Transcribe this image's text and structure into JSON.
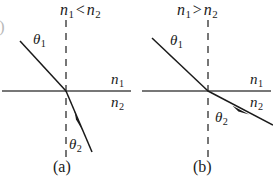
{
  "figure": {
    "background_color": "#ffffff",
    "ink_color": "#1a1a1a",
    "edge_artifact": ")"
  },
  "panels": [
    {
      "id": "a",
      "caption": "(a)",
      "condition": {
        "n_first": "n",
        "n_first_sub": "1",
        "relation": "<",
        "n_second": "n",
        "n_second_sub": "2",
        "full": "n1 < n2"
      },
      "incident_angle_label": "θ",
      "incident_angle_sub": "1",
      "refracted_angle_label": "θ",
      "refracted_angle_sub": "2",
      "medium_upper": "n",
      "medium_upper_sub": "1",
      "medium_lower": "n",
      "medium_lower_sub": "2",
      "behavior": "ray bends toward the normal"
    },
    {
      "id": "b",
      "caption": "(b)",
      "condition": {
        "n_first": "n",
        "n_first_sub": "1",
        "relation": ">",
        "n_second": "n",
        "n_second_sub": "2",
        "full": "n1 > n2"
      },
      "incident_angle_label": "θ",
      "incident_angle_sub": "1",
      "refracted_angle_label": "θ",
      "refracted_angle_sub": "2",
      "medium_upper": "n",
      "medium_upper_sub": "1",
      "medium_lower": "n",
      "medium_lower_sub": "2",
      "behavior": "ray bends away from the normal"
    }
  ],
  "geometry": {
    "panel_a": {
      "interface_y": 91,
      "interface_x_start": 2,
      "interface_x_end": 131,
      "normal_x": 66,
      "normal_y_top": 20,
      "normal_y_bottom": 160,
      "incident_start": [
        20,
        41
      ],
      "incident_end": [
        66,
        91
      ],
      "refracted_start": [
        66,
        91
      ],
      "refracted_end": [
        92,
        152
      ]
    },
    "panel_b": {
      "interface_y": 91,
      "interface_x_start": 142,
      "interface_x_end": 271,
      "normal_x": 208,
      "normal_y_top": 20,
      "normal_y_bottom": 160,
      "incident_start": [
        152,
        38
      ],
      "incident_end": [
        208,
        91
      ],
      "refracted_start": [
        208,
        91
      ],
      "refracted_end": [
        272,
        125
      ]
    }
  }
}
